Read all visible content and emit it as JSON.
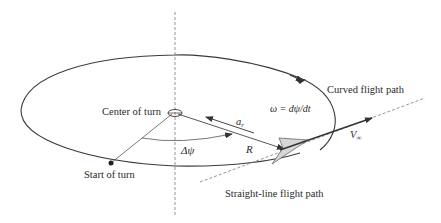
{
  "diagram": {
    "type": "aircraft-level-turn-geometry",
    "labels": {
      "center_of_turn": "Center of turn",
      "start_of_turn": "Start of turn",
      "curved_flight_path": "Curved flight path",
      "straight_line_flight_path": "Straight-line flight path",
      "angular_velocity": "ω = dψ/dt",
      "heading_change": "Δψ",
      "radius": "R",
      "radial_acceleration": "a",
      "radial_acceleration_subscript": "r",
      "freestream_velocity": "V",
      "freestream_velocity_subscript": "∞"
    },
    "colors": {
      "line": "#3a3a3a",
      "dashed": "#7a7a7a",
      "aircraft_fill": "#d6d6d6",
      "aircraft_stroke": "#555555",
      "background": "#ffffff"
    }
  }
}
